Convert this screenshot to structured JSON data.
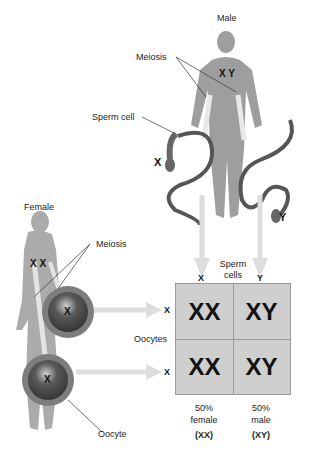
{
  "male": {
    "label": "Male",
    "chromosomes": "X Y",
    "meiosis_label": "Meiosis",
    "sperm_cell_label": "Sperm cell",
    "sperm_x": "X",
    "sperm_y": "Y"
  },
  "female": {
    "label": "Female",
    "chromosomes": "X X",
    "meiosis_label": "Meiosis",
    "oocyte_label": "Oocyte",
    "egg_1": "X",
    "egg_2": "X"
  },
  "punnett": {
    "col_header_label": "Sperm cells",
    "col_headers": [
      "X",
      "Y"
    ],
    "row_header_label": "Oocytes",
    "row_headers": [
      "X",
      "X"
    ],
    "cells": [
      [
        "XX",
        "XY"
      ],
      [
        "XX",
        "XY"
      ]
    ],
    "results": [
      {
        "percent": "50%",
        "sex": "female",
        "genotype": "(XX)"
      },
      {
        "percent": "50%",
        "sex": "male",
        "genotype": "(XY)"
      }
    ]
  }
}
